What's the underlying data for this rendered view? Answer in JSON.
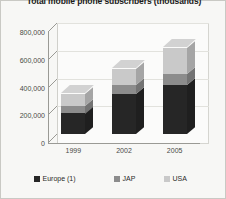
{
  "chart": {
    "title": "Total mobile phone subscribers (thousands)"
  },
  "chart_data": {
    "type": "bar",
    "subtype": "stacked-column-3d",
    "title": "Total mobile phone subscribers (thousands)",
    "xlabel": "",
    "ylabel": "",
    "categories": [
      "1999",
      "2002",
      "2005"
    ],
    "ytick_labels": [
      "0",
      "200,000",
      "400,000",
      "600,000",
      "800,000"
    ],
    "ytick_values": [
      0,
      200000,
      400000,
      600000,
      800000
    ],
    "ylim": [
      0,
      800000
    ],
    "grid": true,
    "legend_position": "bottom",
    "series": [
      {
        "name": "Europe (1)",
        "color": "#262626",
        "values": [
          150000,
          285000,
          350000
        ]
      },
      {
        "name": "JAP",
        "color": "#8c8c8c",
        "values": [
          55000,
          65000,
          80000
        ]
      },
      {
        "name": "USA",
        "color": "#c9c9c9",
        "values": [
          85000,
          115000,
          190000
        ]
      }
    ],
    "totals": [
      290000,
      465000,
      620000
    ]
  },
  "legend": {
    "items": [
      {
        "label": "Europe (1)",
        "color": "#262626"
      },
      {
        "label": "JAP",
        "color": "#8c8c8c"
      },
      {
        "label": "USA",
        "color": "#c9c9c9"
      }
    ]
  }
}
